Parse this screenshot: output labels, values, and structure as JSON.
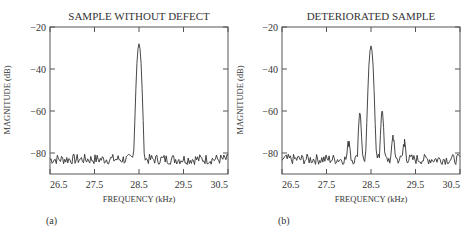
{
  "chart_data": [
    {
      "type": "line",
      "panel_label": "(a)",
      "title": "SAMPLE WITHOUT DEFECT",
      "xlabel": "FREQUENCY (kHz)",
      "ylabel": "MAGNITUDE (dB)",
      "xlim": [
        26.5,
        30.5
      ],
      "ylim": [
        -90,
        -20
      ],
      "xticks": [
        "26.5",
        "27.5",
        "28.5",
        "29.5",
        "30.5"
      ],
      "yticks": [
        "-20",
        "-40",
        "-60",
        "-80"
      ],
      "grid": false,
      "series": [
        {
          "name": "spectrum",
          "peaks": [
            {
              "x": 28.5,
              "y": -28
            }
          ],
          "noise_floor": -83
        }
      ]
    },
    {
      "type": "line",
      "panel_label": "(b)",
      "title": "DETERIORATED SAMPLE",
      "xlabel": "FREQUENCY (kHz)",
      "ylabel": "MAGNITUDE (dB)",
      "xlim": [
        26.5,
        30.5
      ],
      "ylim": [
        -90,
        -20
      ],
      "xticks": [
        "26.5",
        "27.5",
        "28.5",
        "29.5",
        "30.5"
      ],
      "yticks": [
        "-20",
        "-40",
        "-60",
        "-80"
      ],
      "grid": false,
      "series": [
        {
          "name": "spectrum",
          "peaks": [
            {
              "x": 28.0,
              "y": -77
            },
            {
              "x": 28.25,
              "y": -61
            },
            {
              "x": 28.5,
              "y": -29
            },
            {
              "x": 28.75,
              "y": -60
            },
            {
              "x": 29.0,
              "y": -74
            },
            {
              "x": 29.25,
              "y": -77
            }
          ],
          "noise_floor": -83
        }
      ]
    }
  ]
}
